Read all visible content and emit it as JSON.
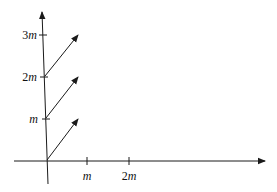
{
  "diagram": {
    "colors": {
      "stroke": "#1a1a1a",
      "background": "#ffffff"
    },
    "origin": {
      "x": 47,
      "y": 161
    },
    "y_axis_labels": [
      {
        "coef": "",
        "unit": "m",
        "y": 119
      },
      {
        "coef": "2",
        "unit": "m",
        "y": 77
      },
      {
        "coef": "3",
        "unit": "m",
        "y": 35
      }
    ],
    "x_axis_labels": [
      {
        "coef": "",
        "unit": "m",
        "x": 87
      },
      {
        "coef": "2",
        "unit": "m",
        "x": 129
      }
    ],
    "vectors": [
      {
        "from": [
          47,
          160
        ],
        "to": [
          78,
          119
        ]
      },
      {
        "from": [
          46,
          118
        ],
        "to": [
          78,
          77
        ]
      },
      {
        "from": [
          45,
          76
        ],
        "to": [
          78,
          35
        ]
      }
    ]
  }
}
